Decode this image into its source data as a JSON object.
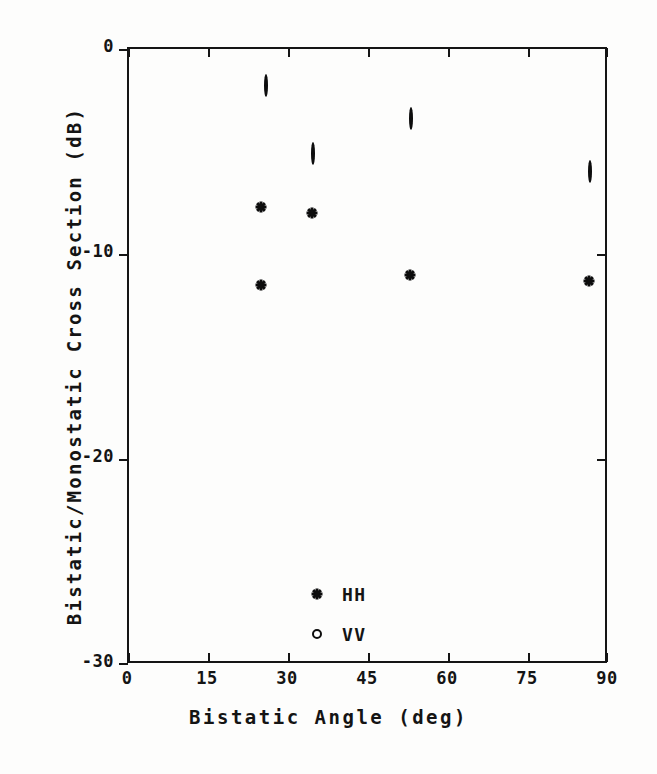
{
  "chart_data": {
    "type": "scatter",
    "title": "",
    "xlabel": "Bistatic Angle (deg)",
    "ylabel": "Bistatic/Monostatic Cross Section (dB)",
    "xlim": [
      0,
      90
    ],
    "ylim": [
      -30,
      0
    ],
    "xticks": [
      0,
      15,
      30,
      45,
      60,
      75,
      90
    ],
    "xtick_labels": [
      "0",
      "15",
      "30",
      "45",
      "60",
      "75",
      "90"
    ],
    "yticks": [
      0,
      -10,
      -20,
      -30
    ],
    "ytick_labels": [
      "0",
      "-10",
      "-20",
      "-30"
    ],
    "grid": false,
    "legend_position": "lower-left-inside",
    "series": [
      {
        "name": "HH",
        "marker": "asterisk",
        "color": "#0d0d0d",
        "points": [
          {
            "x": 24.8,
            "y": -7.7
          },
          {
            "x": 24.8,
            "y": -11.5
          },
          {
            "x": 34.3,
            "y": -8.0
          },
          {
            "x": 52.7,
            "y": -11.0
          },
          {
            "x": 86.3,
            "y": -11.3
          }
        ]
      },
      {
        "name": "VV",
        "marker": "open-circle",
        "color": "#0d0d0d",
        "points": [
          {
            "x": 25.7,
            "y": -1.8
          },
          {
            "x": 34.5,
            "y": -5.1
          },
          {
            "x": 52.9,
            "y": -3.4
          },
          {
            "x": 86.4,
            "y": -6.0
          }
        ]
      }
    ]
  },
  "axes": {
    "x_title": "Bistatic Angle (deg)",
    "y_title": "Bistatic/Monostatic Cross Section (dB)",
    "x_tick_labels": [
      "0",
      "15",
      "30",
      "45",
      "60",
      "75",
      "90"
    ],
    "y_tick_labels": [
      "0",
      "-10",
      "-20",
      "-30"
    ]
  },
  "legend": {
    "entries": [
      {
        "symbol": "asterisk-marker-icon",
        "label": "HH"
      },
      {
        "symbol": "circle-marker-icon",
        "label": "VV"
      }
    ]
  }
}
